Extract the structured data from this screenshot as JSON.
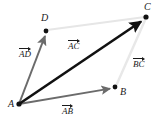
{
  "figure": {
    "width": 159,
    "height": 118,
    "background": "#ffffff"
  },
  "points": [
    {
      "id": "A",
      "label": "A",
      "x": 19,
      "y": 104,
      "label_x": 8,
      "label_y": 100,
      "dot_color": "#111111",
      "dot_r": 2.6
    },
    {
      "id": "B",
      "label": "B",
      "x": 115,
      "y": 87,
      "label_x": 120,
      "label_y": 88,
      "dot_color": "#111111",
      "dot_r": 2.4
    },
    {
      "id": "C",
      "label": "C",
      "x": 146,
      "y": 17,
      "label_x": 144,
      "label_y": 3,
      "dot_color": "#111111",
      "dot_r": 2.6
    },
    {
      "id": "D",
      "label": "D",
      "x": 46,
      "y": 31,
      "label_x": 41,
      "label_y": 14,
      "dot_color": "#111111",
      "dot_r": 2.4
    }
  ],
  "vectors": [
    {
      "id": "AD",
      "from": "A",
      "to": "D",
      "x1": 19,
      "y1": 104,
      "x2": 46,
      "y2": 33,
      "color": "#6b6b6b",
      "width": 2.0,
      "arrowhead": true,
      "label": "AD",
      "label_x": 19,
      "label_y": 46
    },
    {
      "id": "AC",
      "from": "A",
      "to": "C",
      "x1": 19,
      "y1": 104,
      "x2": 145,
      "y2": 19,
      "color": "#111111",
      "width": 2.6,
      "arrowhead": true,
      "label": "AC",
      "label_x": 68,
      "label_y": 38
    },
    {
      "id": "AB",
      "from": "A",
      "to": "B",
      "x1": 19,
      "y1": 104,
      "x2": 114,
      "y2": 88,
      "color": "#6b6b6b",
      "width": 1.9,
      "arrowhead": true,
      "label": "AB",
      "label_x": 62,
      "label_y": 103
    }
  ],
  "guide_lines": [
    {
      "id": "DC",
      "from": "D",
      "to": "C",
      "x1": 47,
      "y1": 30,
      "x2": 145,
      "y2": 17,
      "color": "#e6e6e6",
      "width": 2.2
    },
    {
      "id": "BC",
      "from": "B",
      "to": "C",
      "x1": 116,
      "y1": 86,
      "x2": 146,
      "y2": 18,
      "color": "#e8e8e8",
      "width": 2.4,
      "label": "BC",
      "label_x": 133,
      "label_y": 56
    }
  ],
  "guide_labels": [
    {
      "id": "BC",
      "label": "BC",
      "label_x": 133,
      "label_y": 56
    }
  ],
  "colors": {
    "ink": "#111111",
    "gray_vector": "#6b6b6b",
    "faint_line": "#e6e6e6",
    "background": "#ffffff"
  }
}
